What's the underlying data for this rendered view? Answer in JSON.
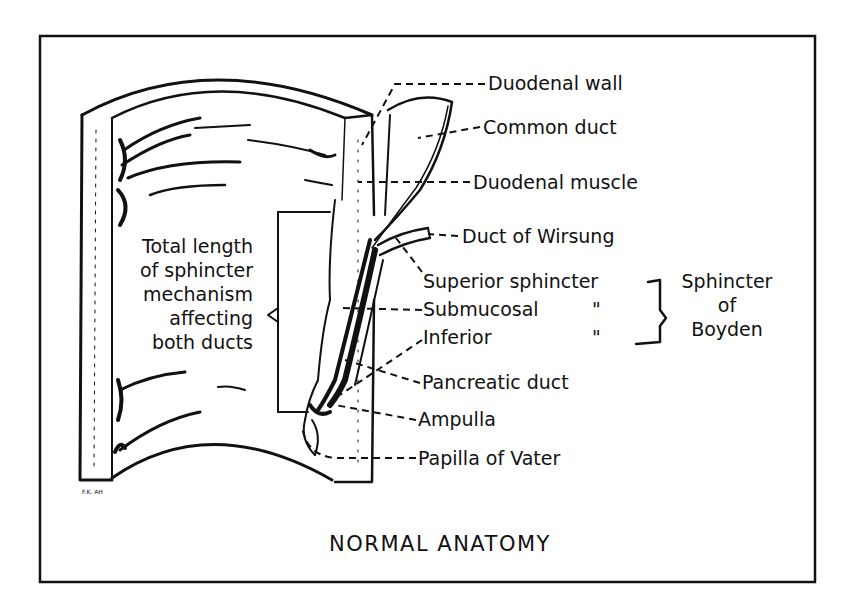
{
  "figure": {
    "title": "NORMAL ANATOMY",
    "artist_initials": "F.K. AH",
    "labels": {
      "duodenal_wall": "Duodenal wall",
      "common_duct": "Common duct",
      "duodenal_muscle": "Duodenal muscle",
      "duct_of_wirsung": "Duct of Wirsung",
      "superior_sphincter": "Superior sphincter",
      "submucosal": "Submucosal",
      "inferior": "Inferior",
      "ditto_1": "\"",
      "ditto_2": "\"",
      "pancreatic_duct": "Pancreatic duct",
      "ampulla": "Ampulla",
      "papilla_of_vater": "Papilla of Vater"
    },
    "sphincter_group": {
      "line1": "Sphincter",
      "line2": "of",
      "line3": "Boyden"
    },
    "total_length_note": {
      "line1": "Total length",
      "line2": "of sphincter",
      "line3": "mechanism",
      "line4": "affecting",
      "line5": "both ducts"
    }
  }
}
